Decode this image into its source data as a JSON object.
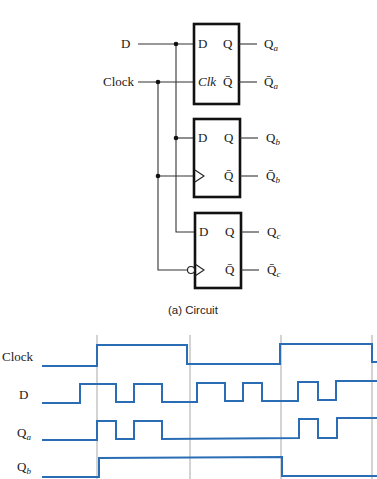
{
  "circuit": {
    "inputs": {
      "d_label": "D",
      "clock_label": "Clock"
    },
    "flipflops": [
      {
        "name": "a",
        "type": "gated D latch",
        "d_pin": "D",
        "clk_pin": "Clk",
        "q_pin": "Q",
        "qbar_pin": "Q̄",
        "out_q": "Q",
        "out_q_sub": "a",
        "out_qbar": "Q̄",
        "out_qbar_sub": "a"
      },
      {
        "name": "b",
        "type": "positive-edge-triggered D flip-flop",
        "d_pin": "D",
        "clk_pin": "",
        "q_pin": "Q",
        "qbar_pin": "Q̄",
        "out_q": "Q",
        "out_q_sub": "b",
        "out_qbar": "Q̄",
        "out_qbar_sub": "b"
      },
      {
        "name": "c",
        "type": "negative-edge-triggered D flip-flop",
        "d_pin": "D",
        "clk_pin": "",
        "q_pin": "Q",
        "qbar_pin": "Q̄",
        "out_q": "Q",
        "out_q_sub": "c",
        "out_qbar": "Q̄",
        "out_qbar_sub": "c"
      }
    ],
    "caption": "(a) Circuit"
  },
  "timing": {
    "signals": [
      {
        "label": "Clock",
        "sub": ""
      },
      {
        "label": "D",
        "sub": ""
      },
      {
        "label": "Q",
        "sub": "a"
      },
      {
        "label": "Q",
        "sub": "b"
      }
    ],
    "gridlines_x": [
      97,
      190,
      281,
      372
    ],
    "colors": {
      "waveform": "#2a6db5",
      "gridline": "#a8a8a8"
    }
  }
}
